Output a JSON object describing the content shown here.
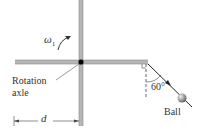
{
  "diagram": {
    "labels": {
      "angular_velocity_symbol": "ω",
      "angular_velocity_subscript": "1",
      "axle_line1": "Rotation",
      "axle_line2": "axle",
      "angle": "60°",
      "ball": "Ball",
      "distance": "d"
    },
    "colors": {
      "rod": "#b5b5b5",
      "rod_edge": "#8c8c8c",
      "axle_point": "#000000",
      "string": "#222222",
      "ball": "#9a9a9a",
      "text": "#333333"
    },
    "geometry": {
      "angle_deg": 60,
      "pivot": [
        81,
        62
      ],
      "arm_end": [
        148,
        62
      ],
      "ball_center": [
        182,
        98
      ]
    }
  }
}
